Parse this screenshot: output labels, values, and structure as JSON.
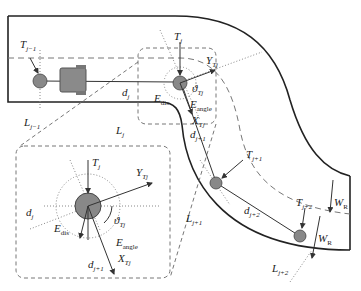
{
  "diagram": {
    "title": "",
    "colors": {
      "road_edge": "#222222",
      "dashed": "#777777",
      "target_fill": "#888888",
      "vehicle_fill": "#8a8a8a"
    },
    "labels": {
      "T_prev": {
        "base": "T",
        "sub": "j−1"
      },
      "L_prev": {
        "base": "L",
        "sub": "j−1"
      },
      "d_j": {
        "base": "d",
        "sub": "j"
      },
      "L_j": {
        "base": "L",
        "sub": "j"
      },
      "T_j": {
        "base": "T",
        "sub": "j"
      },
      "Y_Tj": {
        "base": "Y",
        "sub": "Tj"
      },
      "theta_Tj": {
        "base": "ϑ",
        "sub": "Tj"
      },
      "E_dis": {
        "base": "E",
        "sub": "dis"
      },
      "E_angle": {
        "base": "E",
        "sub": "angle"
      },
      "X_Tj": {
        "base": "X",
        "sub": "Tj"
      },
      "d_next": {
        "base": "d",
        "sub": "j+1"
      },
      "T_next": {
        "base": "T",
        "sub": "j+1"
      },
      "L_next": {
        "base": "L",
        "sub": "j+1"
      },
      "d_next2": {
        "base": "d",
        "sub": "j+2"
      },
      "T_next2": {
        "base": "T",
        "sub": "j+2"
      },
      "L_next2": {
        "base": "L",
        "sub": "j+2"
      },
      "W_R_1": {
        "base": "W",
        "sub": "R"
      },
      "W_R_2": {
        "base": "W",
        "sub": "R"
      }
    },
    "inset": {
      "T_j": {
        "base": "T",
        "sub": "j"
      },
      "Y_Tj": {
        "base": "Y",
        "sub": "Tj"
      },
      "d_j": {
        "base": "d",
        "sub": "j"
      },
      "theta_Tj": {
        "base": "ϑ",
        "sub": "Tj"
      },
      "E_dis": {
        "base": "E",
        "sub": "dis"
      },
      "E_angle": {
        "base": "E",
        "sub": "angle"
      },
      "d_next": {
        "base": "d",
        "sub": "j+1"
      },
      "X_Tj": {
        "base": "X",
        "sub": "Tj"
      }
    }
  }
}
